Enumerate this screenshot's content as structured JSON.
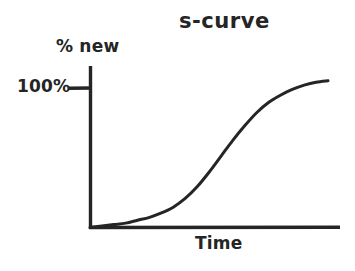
{
  "canvas": {
    "width": 355,
    "height": 271,
    "background": "#ffffff",
    "ink": "#252525"
  },
  "chart_data": {
    "type": "line",
    "title": "s-curve",
    "xlabel": "Time",
    "ylabel": "% new",
    "grid": false,
    "legend": null,
    "legend_position": "none",
    "style": "hand-drawn sketch, no numeric axis scale, single unlabeled sigmoid curve",
    "line_color": "#252525",
    "line_width": 3,
    "axis_color": "#252525",
    "axis_width": 3,
    "xlim": [
      0,
      1
    ],
    "ylim": [
      0,
      1.08
    ],
    "x_tick_labels": [],
    "y_tick_labels": [
      "100%"
    ],
    "y_ticks": [
      1.0
    ],
    "annotations": [
      {
        "text": "100%",
        "kind": "y-axis-tick-label",
        "value": 1.0,
        "note": "tick stub drawn to the left of the y-axis marking the saturation level"
      }
    ],
    "series": [
      {
        "name": "adoption",
        "shape": "sigmoid",
        "inflection_x": 0.52,
        "asymptote_y": 1.0,
        "x": [
          0.0,
          0.05,
          0.1,
          0.15,
          0.2,
          0.25,
          0.3,
          0.35,
          0.4,
          0.45,
          0.5,
          0.55,
          0.6,
          0.65,
          0.7,
          0.75,
          0.8,
          0.85,
          0.9,
          0.95,
          1.0
        ],
        "values": [
          0.0,
          0.01,
          0.02,
          0.03,
          0.05,
          0.07,
          0.1,
          0.14,
          0.2,
          0.28,
          0.38,
          0.49,
          0.6,
          0.7,
          0.79,
          0.86,
          0.91,
          0.95,
          0.98,
          1.0,
          1.01
        ]
      }
    ]
  },
  "labels": {
    "title": "s-curve",
    "y_axis": "% new",
    "y_tick": "100%",
    "x_axis": "Time"
  }
}
